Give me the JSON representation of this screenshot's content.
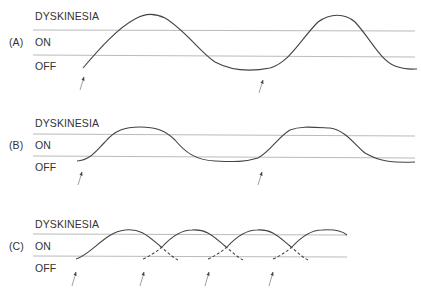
{
  "panels": [
    {
      "id": "A",
      "tag": "(A)",
      "levels": {
        "dyskinesia": "DYSKINESIA",
        "on": "ON",
        "off": "OFF"
      }
    },
    {
      "id": "B",
      "tag": "(B)",
      "levels": {
        "dyskinesia": "DYSKINESIA",
        "on": "ON",
        "off": "OFF"
      }
    },
    {
      "id": "C",
      "tag": "(C)",
      "levels": {
        "dyskinesia": "DYSKINESIA",
        "on": "ON",
        "off": "OFF"
      }
    }
  ],
  "colors": {
    "curve": "#444444",
    "threshold": "#bbbbbb",
    "text": "#333333"
  }
}
